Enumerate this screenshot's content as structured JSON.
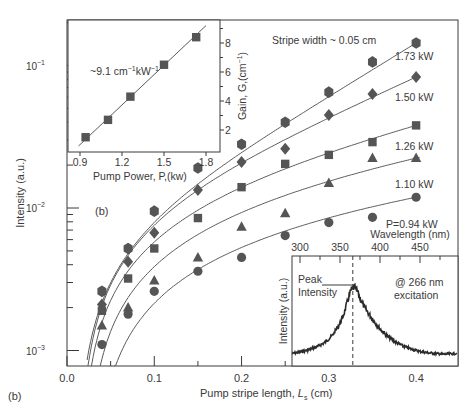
{
  "figure_label": "(b)",
  "chart_data": [
    {
      "id": "main",
      "type": "scatter",
      "title": "",
      "xlabel": "Pump stripe length, L_s (cm)",
      "xlabel_main": "Pump stripe length, ",
      "xlabel_var": "L",
      "xlabel_sub": "s",
      "xlabel_unit": " (cm)",
      "ylabel": "Intensity (a.u.)",
      "xlim": [
        0.0,
        0.448
      ],
      "ylim": [
        0.00073,
        0.2
      ],
      "yscale": "log",
      "xticks": [
        0.0,
        0.1,
        0.2,
        0.3,
        0.4
      ],
      "xtick_labels": [
        "0.0",
        "0.1",
        "0.2",
        "0.3",
        "0.4"
      ],
      "yticks": [
        0.001,
        0.01,
        0.1
      ],
      "ytick_labels": [
        "10",
        "10",
        "10"
      ],
      "ytick_exponents": [
        "−3",
        "−2",
        "−1"
      ],
      "annotations": {
        "panel": "(b)",
        "stripe_width": "Stripe width ~ 0.05 cm"
      },
      "grid": false,
      "series": [
        {
          "name": "1.73 kW",
          "label": "1.73 kW",
          "marker": "hexagon",
          "x": [
            0.04,
            0.07,
            0.1,
            0.15,
            0.2,
            0.25,
            0.3,
            0.35,
            0.4
          ],
          "y": [
            0.0026,
            0.0052,
            0.0095,
            0.0191,
            0.028,
            0.04,
            0.065,
            0.106,
            0.144
          ],
          "fit_gain": 9.0,
          "fit_offset": 0.011
        },
        {
          "name": "1.50 kW",
          "label": "1.50 kW",
          "marker": "diamond",
          "x": [
            0.04,
            0.07,
            0.1,
            0.15,
            0.2,
            0.25,
            0.3,
            0.35,
            0.4
          ],
          "y": [
            0.0021,
            0.0042,
            0.0067,
            0.0134,
            0.021,
            0.026,
            0.045,
            0.063,
            0.083
          ],
          "fit_gain": 6.9,
          "fit_offset": 0.014
        },
        {
          "name": "1.26 kW",
          "label": "1.26 kW",
          "marker": "square",
          "x": [
            0.04,
            0.07,
            0.1,
            0.15,
            0.2,
            0.25,
            0.3,
            0.35,
            0.4
          ],
          "y": [
            0.0019,
            0.0032,
            0.0052,
            0.0085,
            0.014,
            0.0204,
            0.0236,
            0.029,
            0.038
          ],
          "fit_gain": 4.3,
          "fit_offset": 0.016
        },
        {
          "name": "1.10 kW",
          "label": "1.10 kW",
          "marker": "triangle",
          "x": [
            0.04,
            0.07,
            0.1,
            0.15,
            0.2,
            0.25,
            0.3,
            0.35,
            0.4
          ],
          "y": [
            0.0015,
            0.002,
            0.0031,
            0.0045,
            0.0074,
            0.0092,
            0.015,
            0.0224,
            0.0224
          ],
          "fit_gain": 3.0,
          "fit_offset": 0.022
        },
        {
          "name": "P=0.94 kW",
          "label": "P=0.94 kW",
          "marker": "circle",
          "x": [
            0.04,
            0.07,
            0.1,
            0.15,
            0.2,
            0.25,
            0.3,
            0.35,
            0.4
          ],
          "y": [
            0.0011,
            0.0018,
            0.0026,
            0.0036,
            0.0045,
            0.0064,
            0.0079,
            0.0086,
            0.0119
          ],
          "fit_gain": 1.6,
          "fit_offset": 0.03
        }
      ]
    },
    {
      "id": "inset_gain",
      "type": "scatter",
      "title": "",
      "xlabel": "Pump Power, P,(kw)",
      "ylabel": "Gain, G,(cm⁻¹)",
      "xlim": [
        0.85,
        1.88
      ],
      "ylim": [
        0.5,
        9.3
      ],
      "xticks": [
        0.9,
        1.2,
        1.5,
        1.8
      ],
      "xtick_labels": [
        "0.9",
        "1.2",
        "1.5",
        "1.8"
      ],
      "yticks": [
        2,
        4,
        6,
        8
      ],
      "ytick_labels": [
        "2",
        "4",
        "6",
        "8"
      ],
      "annotation": "~9.1 cm⁻¹kW⁻¹",
      "annotation_parts": [
        "~9.1 cm",
        "−1",
        "kW",
        "−1"
      ],
      "ylabel_parts": [
        "Gain, G,(cm",
        "−1",
        ")"
      ],
      "series": [
        {
          "name": "Gain",
          "marker": "square",
          "x": [
            0.94,
            1.1,
            1.26,
            1.5,
            1.73
          ],
          "y": [
            1.5,
            2.7,
            4.3,
            6.5,
            8.4
          ]
        }
      ],
      "fit_line": {
        "x": [
          0.89,
          1.8
        ],
        "y": [
          0.9,
          9.2
        ]
      }
    },
    {
      "id": "inset_spectrum",
      "type": "line",
      "title": "",
      "xlabel": "Wavelength (nm)",
      "ylabel": "Intensity (a.u.)",
      "xlim": [
        290,
        496
      ],
      "xticks": [
        300,
        350,
        400,
        450
      ],
      "xtick_labels": [
        "300",
        "350",
        "400",
        "450"
      ],
      "peak_wavelength": 366,
      "annotations": {
        "peak_line1": "Peak",
        "peak_line2": "Intensity",
        "excitation_line1": "@ 266 nm",
        "excitation_line2": "excitation"
      },
      "series": [
        {
          "name": "Emission spectrum",
          "x": [
            290,
            300,
            310,
            320,
            330,
            340,
            350,
            355,
            360,
            364,
            368,
            372,
            376,
            380,
            390,
            400,
            410,
            420,
            430,
            440,
            450,
            460,
            470,
            480,
            496
          ],
          "y": [
            0.05,
            0.07,
            0.1,
            0.14,
            0.2,
            0.3,
            0.48,
            0.62,
            0.82,
            0.96,
            1.0,
            0.93,
            0.82,
            0.72,
            0.55,
            0.4,
            0.29,
            0.21,
            0.15,
            0.11,
            0.08,
            0.06,
            0.05,
            0.04,
            0.05
          ]
        }
      ]
    }
  ]
}
